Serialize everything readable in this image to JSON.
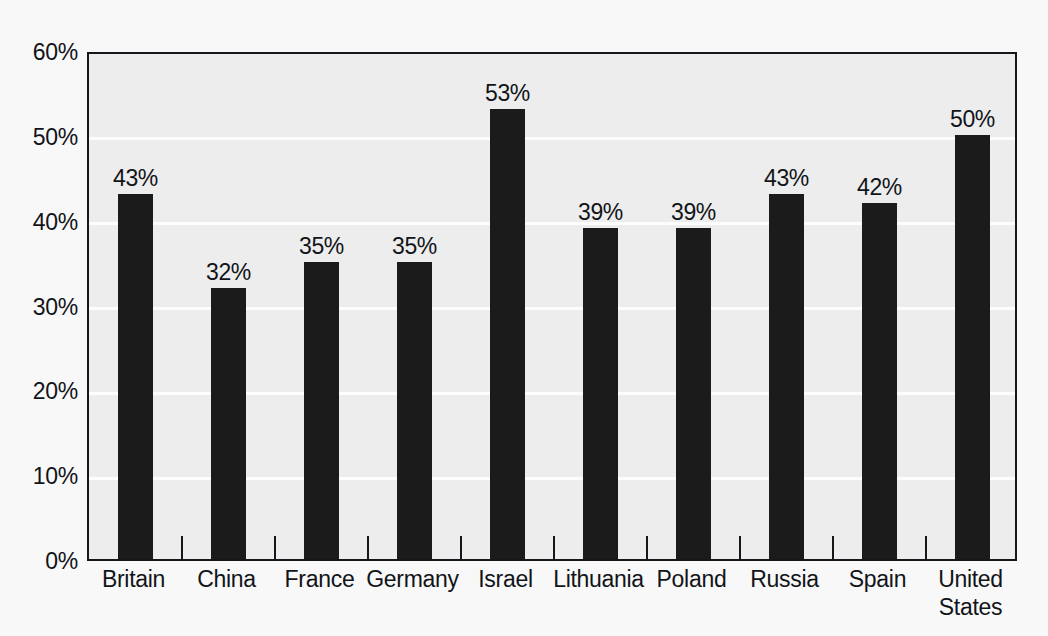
{
  "chart_data": {
    "type": "bar",
    "title": "",
    "subtitle": "",
    "xlabel": "",
    "ylabel": "",
    "ylim": [
      0,
      60
    ],
    "ytick_labels": [
      "0%",
      "10%",
      "20%",
      "30%",
      "40%",
      "50%",
      "60%"
    ],
    "ytick_values": [
      0,
      10,
      20,
      30,
      40,
      50,
      60
    ],
    "grid": true,
    "gridlines_at": [
      10,
      20,
      30,
      40,
      50
    ],
    "legend": null,
    "categories": [
      "Britain",
      "China",
      "France",
      "Germany",
      "Israel",
      "Lithuania",
      "Poland",
      "Russia",
      "Spain",
      "United States"
    ],
    "category_label_lines": [
      [
        "Britain"
      ],
      [
        "China"
      ],
      [
        "France"
      ],
      [
        "Germany"
      ],
      [
        "Israel"
      ],
      [
        "Lithuania"
      ],
      [
        "Poland"
      ],
      [
        "Russia"
      ],
      [
        "Spain"
      ],
      [
        "United",
        "States"
      ]
    ],
    "values": [
      43,
      32,
      35,
      35,
      53,
      39,
      39,
      43,
      42,
      50
    ],
    "data_labels": [
      "43%",
      "32%",
      "35%",
      "35%",
      "53%",
      "39%",
      "39%",
      "43%",
      "42%",
      "50%"
    ]
  },
  "style": {
    "bar_color": "#1b1b1b",
    "plot_background": "#ededed",
    "page_background": "#f8f8f8",
    "gridline_color": "#fdfdfd",
    "axis_color": "#14181c",
    "text_color": "#111418"
  }
}
